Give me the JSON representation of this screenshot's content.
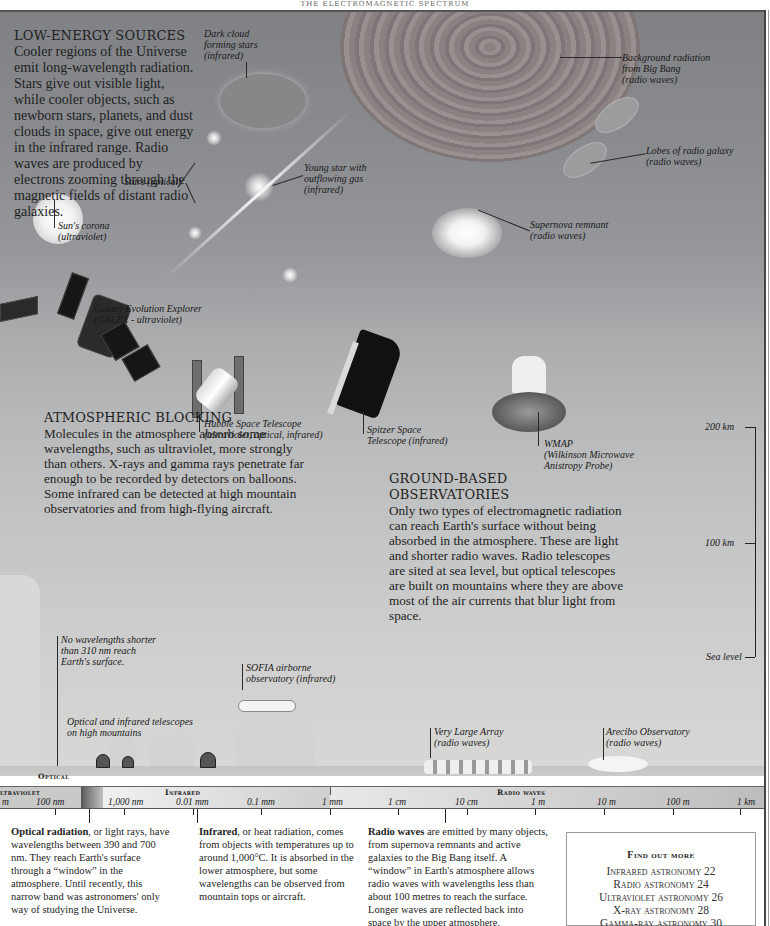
{
  "running_head": "THE ELECTROMAGNETIC SPECTRUM",
  "low_energy": {
    "heading": "LOW-ENERGY SOURCES",
    "body": "Cooler regions of the Universe emit long-wavelength radiation. Stars give out visible light, while cooler objects, such as newborn stars, planets, and dust clouds in space, give out energy in the infrared range. Radio waves are produced by electrons zooming through the magnetic fields of distant radio galaxies."
  },
  "cosmic_labels": {
    "dark_cloud": [
      "Dark cloud",
      "forming stars",
      "(infrared)"
    ],
    "background_radiation": [
      "Background radiation",
      "from Big Bang",
      "(radio waves)"
    ],
    "radio_galaxy": [
      "Lobes of radio galaxy",
      "(radio waves)"
    ],
    "stars": [
      "Stars (optical)"
    ],
    "young_star": [
      "Young star with",
      "outflowing gas",
      "(infrared)"
    ],
    "sun_corona": [
      "Sun's corona",
      "(ultraviolet)"
    ],
    "supernova": [
      "Supernova remnant",
      "(radio waves)"
    ]
  },
  "spacecraft_labels": {
    "galex": [
      "Galaxy Evolution Explorer",
      "(GALEX - ultraviolet)"
    ],
    "hubble": [
      "Hubble Space Telescope",
      "(ultraviolet, optical, infrared)"
    ],
    "spitzer": [
      "Spitzer Space",
      "Telescope (infrared)"
    ],
    "wmap": [
      "WMAP",
      "(Wilkinson Microwave",
      "Anistropy Probe)"
    ]
  },
  "atmospheric": {
    "heading": "ATMOSPHERIC BLOCKING",
    "body": "Molecules in the atmosphere absorb some wavelengths, such as ultraviolet, more strongly than others. X-rays and gamma rays penetrate far enough to be recorded by detectors on balloons. Some infrared can be detected at high mountain observatories and from high-flying aircraft."
  },
  "ground_based": {
    "heading": "GROUND-BASED OBSERVATORIES",
    "body": "Only two types of electromagnetic radiation can reach Earth's surface without being absorbed in the atmosphere. These are light and shorter radio waves. Radio telescopes are sited at sea level, but optical telescopes are built on mountains where they are above most of the air currents that blur light from space."
  },
  "ground_labels": {
    "no_wavelengths": [
      "No wavelengths shorter",
      "than 310 nm reach",
      "Earth's surface."
    ],
    "sofia": [
      "SOFIA airborne",
      "observatory (infrared)"
    ],
    "mountain_telescopes": [
      "Optical and infrared telescopes",
      "on high mountains"
    ],
    "vla": [
      "Very Large Array",
      "(radio waves)"
    ],
    "arecibo": [
      "Arecibo Observatory",
      "(radio waves)"
    ]
  },
  "altitude_scale": {
    "top": "200 km",
    "middle": "100 km",
    "bottom": "Sea level"
  },
  "spectrum": {
    "optical_label": "Optical",
    "bands": {
      "ultraviolet": "ltraviolet",
      "infrared": "Infrared",
      "radio": "Radio waves"
    },
    "ticks": [
      "m",
      "100 nm",
      "1,000 nm",
      "0.01 mm",
      "0.1 mm",
      "1 mm",
      "1 cm",
      "10 cm",
      "1 m",
      "10 m",
      "100 m",
      "1 km"
    ]
  },
  "columns": {
    "optical": {
      "lead": "Optical radiation",
      "rest": ", or light rays, have wavelengths between 390 and 700 nm. They reach Earth's surface through a “window” in the atmosphere. Until recently, this narrow band was astronomers' only way of studying the Universe."
    },
    "infrared": {
      "lead": "Infrared",
      "rest": ", or heat radiation, comes from objects with temperatures up to around 1,000°C. It is absorbed in the lower atmosphere, but some wavelengths can be observed from mountain tops or aircraft."
    },
    "radio": {
      "lead": "Radio waves",
      "rest": " are emitted by many objects, from supernova remnants and active galaxies to the Big Bang itself. A “window” in Earth's atmosphere allows radio waves with wavelengths less than about 100 metres to reach the surface. Longer waves are reflected back into space by the upper atmosphere."
    }
  },
  "find_out_more": {
    "title": "Find out more",
    "items": [
      "Infrared astronomy 22",
      "Radio astronomy 24",
      "Ultraviolet astronomy 26",
      "X-ray astronomy 28",
      "Gamma-ray astronomy 30"
    ]
  }
}
